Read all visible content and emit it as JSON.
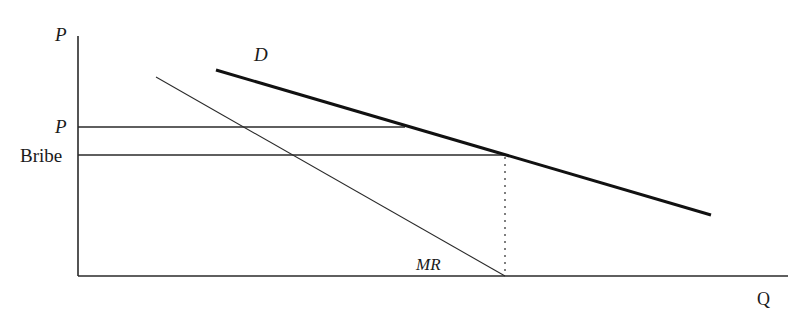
{
  "diagram": {
    "type": "economics-monopoly-bribe",
    "axes": {
      "y_label": "P",
      "x_label": "Q"
    },
    "price_levels": [
      {
        "label": "P",
        "y": 127
      },
      {
        "label": "Bribe",
        "y": 155
      }
    ],
    "curves": {
      "demand": {
        "label": "D"
      },
      "marginal_revenue": {
        "label": "MR"
      }
    },
    "colors": {
      "line": "#1a1a1a",
      "background": "#ffffff"
    }
  }
}
